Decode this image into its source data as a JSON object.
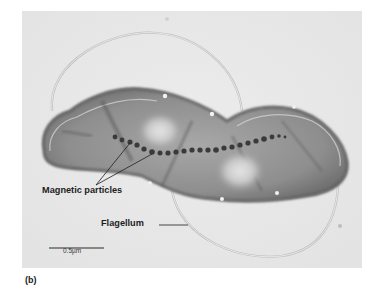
{
  "figure": {
    "panel_label": "(b)",
    "type": "transmission electron micrograph",
    "background_color": "#e9e9e9",
    "cell_color": "#8c8c8c",
    "particle_color": "#3a3a3a",
    "labels": {
      "magnetic_particles": "Magnetic particles",
      "flagellum": "Flagellum"
    },
    "scale_bar": {
      "text": "0.5µm",
      "length_px": 55
    }
  }
}
